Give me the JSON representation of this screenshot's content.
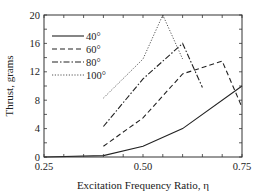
{
  "chart_data": {
    "type": "line",
    "title": "",
    "xlabel": "Excitation Frequency Ratio, η",
    "ylabel": "Thrust, grams",
    "xlim": [
      0.25,
      0.75
    ],
    "ylim": [
      0,
      20
    ],
    "xticks": [
      0.25,
      0.5,
      0.75
    ],
    "xtick_labels": [
      "0.25",
      "0.50",
      "0.75"
    ],
    "yticks": [
      0,
      4,
      8,
      12,
      16,
      20
    ],
    "ytick_labels": [
      "0",
      "4",
      "8",
      "12",
      "16",
      "20"
    ],
    "grid": false,
    "legend_position": "upper left",
    "series": [
      {
        "name": "40°",
        "style": "solid",
        "x": [
          0.25,
          0.4,
          0.5,
          0.6,
          0.75
        ],
        "y": [
          0,
          0.2,
          1.5,
          4.0,
          10.0
        ]
      },
      {
        "name": "60°",
        "style": "dashed",
        "x": [
          0.4,
          0.5,
          0.6,
          0.7,
          0.75
        ],
        "y": [
          1.5,
          5.5,
          11.7,
          13.5,
          7.0
        ]
      },
      {
        "name": "80°",
        "style": "dashdot",
        "x": [
          0.4,
          0.5,
          0.6,
          0.65
        ],
        "y": [
          4.3,
          11.0,
          16.0,
          9.8
        ]
      },
      {
        "name": "100°",
        "style": "dotted",
        "x": [
          0.4,
          0.5,
          0.55,
          0.6
        ],
        "y": [
          8.3,
          13.8,
          20.0,
          13.8
        ]
      }
    ]
  }
}
